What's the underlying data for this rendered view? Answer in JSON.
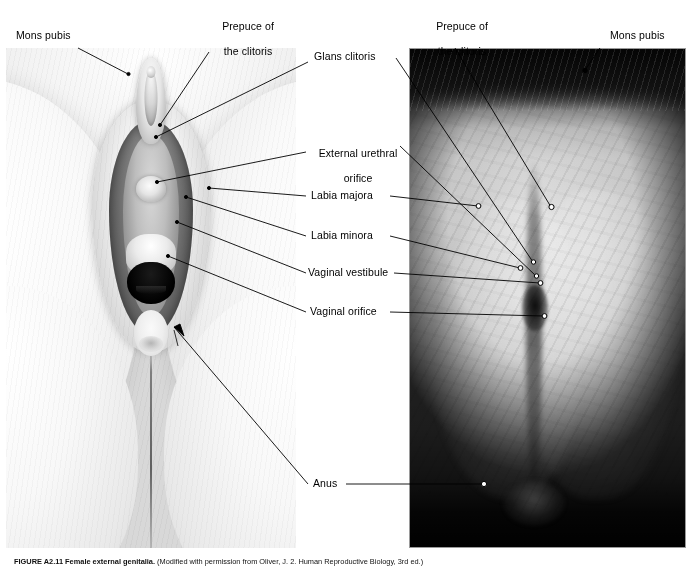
{
  "figure": {
    "panels": {
      "left": {
        "name": "illustration",
        "type": "grayscale anatomical illustration"
      },
      "right": {
        "name": "photograph",
        "type": "grayscale photograph"
      }
    },
    "caption": {
      "number": "FIGURE A2.11",
      "title": "Female external genitalia.",
      "rest": " (Modified with permission from Oliver, J. 2. Human Reproductive Biology, 3rd ed.)"
    }
  },
  "labels": {
    "left_panel": [
      {
        "id": "mons-pubis-left",
        "text": "Mons pubis"
      },
      {
        "id": "prepuce-left",
        "line1": "Prepuce of",
        "line2": "the clitoris"
      },
      {
        "id": "glans-clitoris",
        "text": "Glans clitoris"
      },
      {
        "id": "external-urethral-orifice",
        "line1": "External urethral",
        "line2": "orifice"
      },
      {
        "id": "labia-majora",
        "text": "Labia majora"
      },
      {
        "id": "labia-minora",
        "text": "Labia minora"
      },
      {
        "id": "vaginal-vestibule",
        "text": "Vaginal vestibule"
      },
      {
        "id": "vaginal-orifice",
        "text": "Vaginal orifice"
      },
      {
        "id": "anus",
        "text": "Anus"
      }
    ],
    "right_panel": [
      {
        "id": "prepuce-right",
        "line1": "Prepuce of",
        "line2": "the clitoris"
      },
      {
        "id": "mons-pubis-right",
        "text": "Mons pubis"
      }
    ]
  },
  "colors": {
    "background": "#ffffff",
    "text": "#000000",
    "leader_line": "#000000",
    "photo_border": "#9a9a9a",
    "photo_dark": "#050505"
  }
}
